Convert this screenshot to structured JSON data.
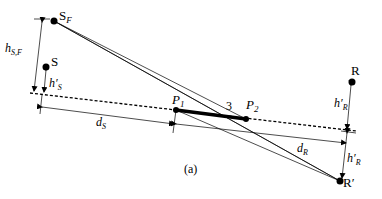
{
  "caption": "(a)",
  "points": {
    "source_far": {
      "label": "S",
      "sub": "F"
    },
    "source": {
      "label": "S"
    },
    "p1": {
      "label": "P",
      "sub": "1"
    },
    "p2": {
      "label": "P",
      "sub": "2"
    },
    "receiver": {
      "label": "R"
    },
    "receiver_image": {
      "label": "R′"
    }
  },
  "segment_label": "3",
  "dimensions": {
    "h_sf": {
      "main": "h",
      "sub": "S,F"
    },
    "h_s": {
      "main": "h′",
      "sub": "S"
    },
    "h_r_top": {
      "main": "h′",
      "sub": "R"
    },
    "h_r_bottom": {
      "main": "h′",
      "sub": "R"
    },
    "d_s": {
      "main": "d",
      "sub": "S"
    },
    "d_r": {
      "main": "d",
      "sub": "R"
    }
  }
}
